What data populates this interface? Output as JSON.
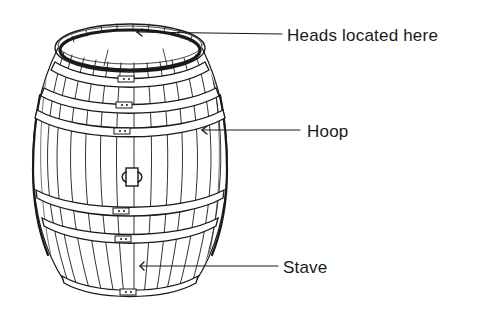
{
  "diagram": {
    "colors": {
      "ink": "#1a1a1a",
      "background": "#ffffff"
    },
    "labels": [
      {
        "id": "heads",
        "text": "Heads located here",
        "points_to": "top rim / head groove"
      },
      {
        "id": "hoop",
        "text": "Hoop",
        "points_to": "metal band around barrel"
      },
      {
        "id": "stave",
        "text": "Stave",
        "points_to": "vertical wooden plank"
      }
    ],
    "parts": {
      "hoop_count": 6,
      "bunghole": "center of barrel belly"
    }
  }
}
